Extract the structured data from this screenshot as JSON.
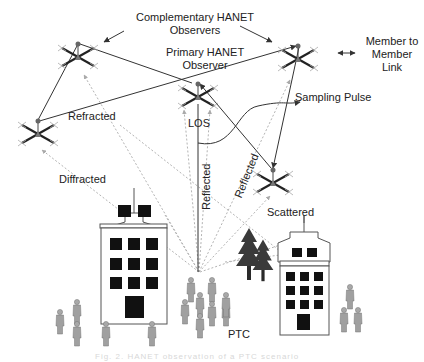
{
  "labels": {
    "complementary_line1": "Complementary HANET",
    "complementary_line2": "Observers",
    "primary_line1": "Primary  HANET",
    "primary_line2": "Observer",
    "legend_line1": "Member to",
    "legend_line2": "Member",
    "legend_line3": "Link",
    "legend_arrow": "⟷",
    "sampling_pulse": "Sampling Pulse",
    "refracted": "Refracted",
    "diffracted": "Diffracted",
    "los": "LOS",
    "reflected_1": "Reflected",
    "reflected_2": "Reflected",
    "scattered": "Scattered",
    "ptc": "PTC"
  },
  "caption": "Fig. 2.  HANET observation of a PTC scenario",
  "colors": {
    "line": "#333333",
    "dotted": "#999999",
    "building_window": "#111111",
    "tree": "#3a3a3a",
    "person": "#9a9a9a",
    "drone_arm": "#222222",
    "drone_body": "#777777"
  },
  "drones": [
    {
      "id": "top-left",
      "x": 78,
      "y": 50
    },
    {
      "id": "primary-center",
      "x": 198,
      "y": 96
    },
    {
      "id": "top-right",
      "x": 298,
      "y": 57
    },
    {
      "id": "left",
      "x": 38,
      "y": 135
    },
    {
      "id": "lower-right",
      "x": 273,
      "y": 181
    }
  ]
}
